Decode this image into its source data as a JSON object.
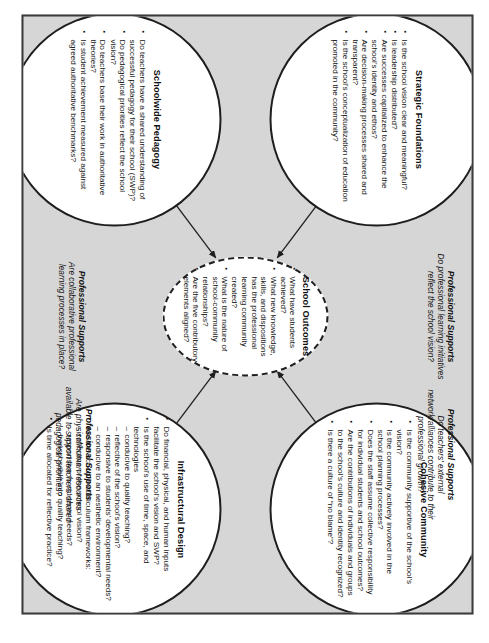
{
  "diagram": {
    "frame_bg": "#d6d6d6",
    "page_bg": "#ffffff",
    "border_color": "#3b3b3b"
  },
  "center": {
    "title": "School Outcomes",
    "questions": [
      "What have students achieved?",
      "What new knowledge, skills, and dispositions has the professional learning community created?",
      "What is the nature of school-community relationships?",
      "Are the five contributory elements aligned?"
    ]
  },
  "circles": [
    {
      "id": "cohesive-community",
      "title": "Cohesive Community",
      "questions": [
        "Is the community supportive of the school's vision?",
        "Is the community actively involved in the school planning processes?",
        "Does the staff assume collective responsibility for individual students and school outcomes?",
        "Are the contributions of individuals and groups to the school's culture and identity recognized?",
        "Is there a culture of “no blame”?"
      ]
    },
    {
      "id": "infrastructural-design",
      "title": "Infrastructural Design",
      "questions": [
        "Do financial, physical, and human inputs facilitate the school's vision and SWP?",
        "Is the school's use of time, space, and technologies"
      ],
      "sub_a": [
        "conducive to quality teaching?",
        "reflective of the school's vision?",
        "responsive to students' developmental needs?",
        "conducive to an aesthetic environment?"
      ],
      "question_b": "Are the school's curriculum frameworks:",
      "sub_b": [
        "reflective of the school vision?",
        "responsive to students' needs?",
        "transposable into quality teaching?"
      ],
      "question_c": "Is time allocated for reflective practice?"
    },
    {
      "id": "strategic-foundations",
      "title": "Strategic Foundations",
      "questions": [
        "Is the school vision clear and meaningful?",
        "Is leadership distributed?",
        "Are successes capitalized to enhance the school's identity and ethos?",
        "Are decision-making processes shared and transparent?",
        "Is the school's conceptualization of education promoted in the community?"
      ]
    },
    {
      "id": "schoolwide-pedagogy",
      "title": "Schoolwide Pedagogy",
      "questions": [
        "Do teachers have a shared understanding of successful pedagogy for their school (SWP)?",
        "Do pedagogical priorities reflect the school vision?",
        "Do teachers base their work in authoritative theories?",
        "Is student achievement measured against agreed authoritative benchmarks?"
      ]
    }
  ],
  "professional_supports": [
    {
      "id": "ps-top-left",
      "title": "Professional Supports",
      "question": "Do professional learning initiatives reflect the school vision?"
    },
    {
      "id": "ps-top-right",
      "title": "Professional Supports",
      "question": "Do teachers' external network/alliances contribute to their professional growth?"
    },
    {
      "id": "ps-bottom-left",
      "title": "Professional Supports",
      "question": "Are collaborative professional learning processes in place?"
    },
    {
      "id": "ps-bottom-right",
      "title": "Professional Supports",
      "question": "Are physical/human resources available to support teachers' shared pedagogical priorities?"
    }
  ]
}
